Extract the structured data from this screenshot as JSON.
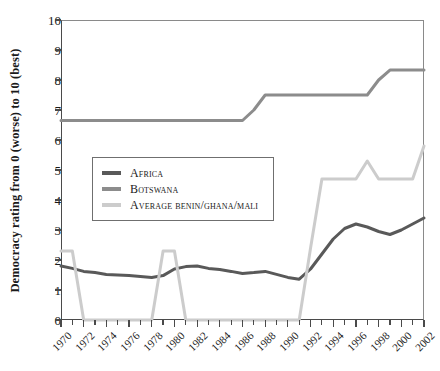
{
  "chart_data": {
    "type": "line",
    "title": "",
    "xlabel": "",
    "ylabel": "Democracy rating from 0 (worse) to 10 (best)",
    "xlim": [
      1970,
      2002
    ],
    "ylim": [
      0,
      10
    ],
    "grid": false,
    "legend_position": "center-left",
    "x": [
      1970,
      1971,
      1972,
      1973,
      1974,
      1975,
      1976,
      1977,
      1978,
      1979,
      1980,
      1981,
      1982,
      1983,
      1984,
      1985,
      1986,
      1987,
      1988,
      1989,
      1990,
      1991,
      1992,
      1993,
      1994,
      1995,
      1996,
      1997,
      1998,
      1999,
      2000,
      2001,
      2002
    ],
    "xtick_labels": [
      "1970",
      "1972",
      "1974",
      "1976",
      "1978",
      "1980",
      "1982",
      "1984",
      "1986",
      "1988",
      "1990",
      "1992",
      "1994",
      "1996",
      "1998",
      "2000",
      "2002"
    ],
    "ytick_labels": [
      "0",
      "1",
      "2",
      "3",
      "4",
      "5",
      "6",
      "7",
      "8",
      "9",
      "10"
    ],
    "series": [
      {
        "name": "Africa",
        "color": "#595959",
        "values": [
          1.8,
          1.72,
          1.62,
          1.58,
          1.52,
          1.5,
          1.48,
          1.45,
          1.42,
          1.48,
          1.7,
          1.78,
          1.8,
          1.72,
          1.68,
          1.62,
          1.55,
          1.58,
          1.62,
          1.52,
          1.42,
          1.36,
          1.7,
          2.2,
          2.7,
          3.05,
          3.2,
          3.1,
          2.95,
          2.85,
          3.0,
          3.2,
          3.4
        ]
      },
      {
        "name": "Botswana",
        "color": "#8c8c8c",
        "values": [
          6.65,
          6.65,
          6.65,
          6.65,
          6.65,
          6.65,
          6.65,
          6.65,
          6.65,
          6.65,
          6.65,
          6.65,
          6.65,
          6.65,
          6.65,
          6.65,
          6.65,
          7.0,
          7.5,
          7.5,
          7.5,
          7.5,
          7.5,
          7.5,
          7.5,
          7.5,
          7.5,
          7.5,
          8.0,
          8.33,
          8.33,
          8.33,
          8.33
        ]
      },
      {
        "name": "Average Benin/Ghana/Mali",
        "color": "#cccccc",
        "values": [
          2.3,
          2.3,
          0.0,
          0.0,
          0.0,
          0.0,
          0.0,
          0.0,
          0.0,
          2.3,
          2.3,
          0.0,
          0.0,
          0.0,
          0.0,
          0.0,
          0.0,
          0.0,
          0.0,
          0.0,
          0.0,
          0.0,
          2.4,
          4.7,
          4.7,
          4.7,
          4.7,
          5.3,
          4.7,
          4.7,
          4.7,
          4.7,
          5.8
        ]
      }
    ]
  },
  "legend": {
    "items": [
      {
        "label": "Africa"
      },
      {
        "label": "Botswana"
      },
      {
        "label": "Average Benin/Ghana/Mali"
      }
    ]
  }
}
